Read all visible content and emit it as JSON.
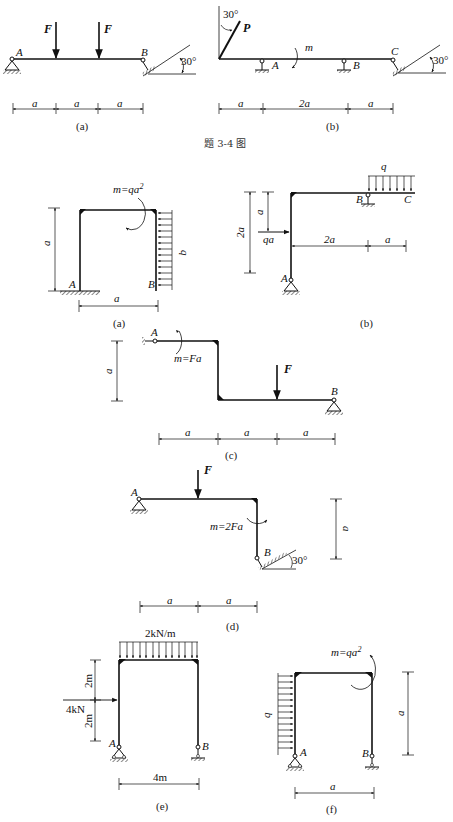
{
  "figure_title": "题 3-4 图",
  "figures": {
    "a1": {
      "caption": "(a)",
      "forces": [
        "F",
        "F"
      ],
      "points": [
        "A",
        "B"
      ],
      "angle": "30°",
      "dims": [
        "a",
        "a",
        "a"
      ]
    },
    "b1": {
      "caption": "(b)",
      "force": "P",
      "force_angle": "30°",
      "moment": "m",
      "points": [
        "A",
        "B",
        "C"
      ],
      "angle": "30°",
      "dims": [
        "a",
        "2a",
        "a"
      ]
    },
    "a2": {
      "caption": "(a)",
      "moment": "m=qa",
      "moment_exp": "2",
      "load": "q",
      "points": [
        "A",
        "B"
      ],
      "dim_h": "a",
      "dim_v": "a"
    },
    "b2": {
      "caption": "(b)",
      "load": "q",
      "force": "qa",
      "points": [
        "A",
        "B",
        "C"
      ],
      "dims_v": [
        "2a",
        "a"
      ],
      "dims_h": [
        "2a",
        "a"
      ]
    },
    "c": {
      "caption": "(c)",
      "moment": "m=Fa",
      "force": "F",
      "points": [
        "A",
        "B"
      ],
      "dim_v": "a",
      "dims_h": [
        "a",
        "a",
        "a"
      ]
    },
    "d": {
      "caption": "(d)",
      "force": "F",
      "moment": "m=2Fa",
      "points": [
        "A",
        "B"
      ],
      "angle": "30°",
      "dim_v": "a",
      "dims_h": [
        "a",
        "a"
      ]
    },
    "e": {
      "caption": "(e)",
      "load": "2kN/m",
      "force": "4kN",
      "points": [
        "A",
        "B"
      ],
      "dims_v": [
        "2m",
        "2m"
      ],
      "dim_h": "4m"
    },
    "f": {
      "caption": "(f)",
      "moment": "m=qa",
      "moment_exp": "2",
      "load": "q",
      "points": [
        "A",
        "B"
      ],
      "dim_v": "a",
      "dim_h": "a"
    }
  }
}
